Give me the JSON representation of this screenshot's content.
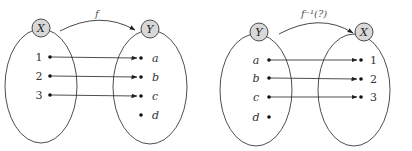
{
  "diagrams": [
    {
      "name": "function-f",
      "mapping_label": "f",
      "domain_set": {
        "name": "X",
        "elements": [
          "1",
          "2",
          "3"
        ]
      },
      "codomain_set": {
        "name": "Y",
        "elements": [
          "a",
          "b",
          "c",
          "d"
        ]
      },
      "mappings": [
        [
          "1",
          "a"
        ],
        [
          "2",
          "b"
        ],
        [
          "3",
          "c"
        ]
      ]
    },
    {
      "name": "inverse-f",
      "mapping_label": "f⁻¹(?)",
      "domain_set": {
        "name": "Y",
        "elements": [
          "a",
          "b",
          "c",
          "d"
        ]
      },
      "codomain_set": {
        "name": "X",
        "elements": [
          "1",
          "2",
          "3"
        ]
      },
      "mappings": [
        [
          "a",
          "1"
        ],
        [
          "b",
          "2"
        ],
        [
          "c",
          "3"
        ]
      ]
    }
  ],
  "colors": {
    "node_fill": "#d8d8d8",
    "stroke": "#3a3a3a",
    "dot": "#111111"
  }
}
